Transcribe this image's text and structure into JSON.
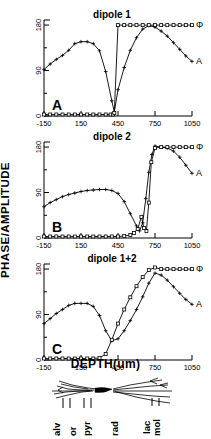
{
  "figure": {
    "axis_y_label": "PHASE/AMPLITUDE",
    "axis_x_label": "DEPTH(um)",
    "series_label_phase": "Φ",
    "series_label_amplitude": "A"
  },
  "panels": [
    {
      "tag": "A",
      "title": "dipole 1",
      "yticks": [
        "180",
        "90",
        "0"
      ],
      "xticks": [
        "-150",
        "150",
        "450",
        "750",
        "1050"
      ]
    },
    {
      "tag": "B",
      "title": "dipole 2",
      "yticks": [
        "180",
        "90",
        "0"
      ],
      "xticks": [
        "-150",
        "150",
        "450",
        "750",
        "1050"
      ]
    },
    {
      "tag": "C",
      "title": "dipole 1+2",
      "yticks": [
        "180",
        "90",
        "0"
      ],
      "xticks": [
        "-150",
        "150",
        "450",
        "750",
        "1050"
      ]
    }
  ],
  "layers": [
    {
      "name": "alv"
    },
    {
      "name": "or"
    },
    {
      "name": "pyr"
    },
    {
      "name": "rad"
    },
    {
      "name": "lac"
    },
    {
      "name": "mol"
    }
  ],
  "chart_data": [
    {
      "type": "line",
      "title": "dipole 1",
      "panel": "A",
      "xlabel": "DEPTH(um)",
      "ylabel": "PHASE/AMPLITUDE",
      "xlim": [
        -150,
        1050
      ],
      "ylim": [
        0,
        190
      ],
      "xticks": [
        -150,
        150,
        450,
        750,
        1050
      ],
      "yticks": [
        0,
        90,
        180
      ],
      "grid": false,
      "legend": [
        "Φ",
        "A"
      ],
      "legend_position": "right-inline",
      "series": [
        {
          "name": "A",
          "label": "A",
          "marker": "plus",
          "x": [
            -150,
            -100,
            -50,
            0,
            50,
            100,
            150,
            200,
            250,
            300,
            350,
            400,
            420,
            450,
            500,
            550,
            600,
            650,
            700,
            750,
            800,
            850,
            900,
            950,
            1000,
            1050
          ],
          "y": [
            92,
            103,
            112,
            120,
            130,
            143,
            147,
            147,
            143,
            129,
            88,
            30,
            8,
            52,
            96,
            130,
            155,
            172,
            179,
            176,
            168,
            158,
            145,
            132,
            119,
            108
          ]
        },
        {
          "name": "Φ",
          "label": "Φ",
          "marker": "square",
          "x": [
            -150,
            -100,
            -50,
            0,
            50,
            100,
            150,
            200,
            250,
            300,
            350,
            390,
            410,
            420,
            450,
            500,
            550,
            600,
            650,
            700,
            750,
            800,
            850,
            900,
            950,
            1000,
            1050
          ],
          "y": [
            3,
            3,
            3,
            3,
            3,
            3,
            3,
            3,
            3,
            3,
            3,
            3,
            3,
            6,
            180,
            180,
            180,
            180,
            180,
            180,
            180,
            180,
            180,
            180,
            180,
            180,
            180
          ]
        }
      ]
    },
    {
      "type": "line",
      "title": "dipole 2",
      "panel": "B",
      "xlabel": "DEPTH(um)",
      "ylabel": "PHASE/AMPLITUDE",
      "xlim": [
        -150,
        1050
      ],
      "ylim": [
        0,
        190
      ],
      "xticks": [
        -150,
        150,
        450,
        750,
        1050
      ],
      "yticks": [
        0,
        90,
        180
      ],
      "grid": false,
      "legend": [
        "Φ",
        "A"
      ],
      "legend_position": "right-inline",
      "series": [
        {
          "name": "A",
          "label": "A",
          "marker": "plus",
          "x": [
            -150,
            -100,
            -50,
            0,
            50,
            100,
            150,
            200,
            250,
            300,
            350,
            400,
            450,
            500,
            550,
            600,
            625,
            650,
            675,
            700,
            725,
            750,
            800,
            850,
            900,
            950,
            1000,
            1050
          ],
          "y": [
            62,
            70,
            76,
            82,
            86,
            89,
            92,
            94,
            95,
            96,
            96,
            94,
            88,
            72,
            48,
            24,
            14,
            30,
            78,
            130,
            165,
            182,
            180,
            178,
            172,
            160,
            144,
            128
          ]
        },
        {
          "name": "Φ",
          "label": "Φ",
          "marker": "square",
          "x": [
            -150,
            -100,
            -50,
            0,
            50,
            100,
            150,
            200,
            250,
            300,
            350,
            400,
            450,
            500,
            550,
            580,
            610,
            640,
            660,
            680,
            700,
            720,
            750,
            800,
            850,
            900,
            950,
            1000,
            1050
          ],
          "y": [
            3,
            3,
            3,
            3,
            3,
            3,
            3,
            3,
            3,
            3,
            3,
            3,
            3,
            4,
            6,
            10,
            18,
            42,
            20,
            14,
            70,
            150,
            178,
            180,
            180,
            180,
            180,
            180,
            180
          ]
        }
      ]
    },
    {
      "type": "line",
      "title": "dipole 1+2",
      "panel": "C",
      "xlabel": "DEPTH(um)",
      "ylabel": "PHASE/AMPLITUDE",
      "xlim": [
        -150,
        1050
      ],
      "ylim": [
        0,
        190
      ],
      "xticks": [
        -150,
        150,
        450,
        750,
        1050
      ],
      "yticks": [
        0,
        90,
        180
      ],
      "grid": false,
      "legend": [
        "Φ",
        "A"
      ],
      "legend_position": "right-inline",
      "series": [
        {
          "name": "A",
          "label": "A",
          "marker": "plus",
          "x": [
            -150,
            -100,
            -50,
            0,
            50,
            100,
            150,
            200,
            250,
            300,
            350,
            400,
            450,
            500,
            550,
            600,
            650,
            700,
            750,
            800,
            850,
            900,
            950,
            1000,
            1050
          ],
          "y": [
            72,
            82,
            92,
            100,
            108,
            112,
            112,
            112,
            106,
            88,
            58,
            38,
            42,
            58,
            78,
            100,
            125,
            152,
            172,
            168,
            158,
            145,
            132,
            120,
            110
          ]
        },
        {
          "name": "Φ",
          "label": "Φ",
          "marker": "square",
          "x": [
            -150,
            -100,
            -50,
            0,
            50,
            100,
            150,
            200,
            250,
            300,
            350,
            400,
            450,
            500,
            550,
            600,
            650,
            700,
            750,
            800,
            850,
            900,
            950,
            1000,
            1050
          ],
          "y": [
            3,
            3,
            3,
            3,
            3,
            3,
            3,
            3,
            3,
            4,
            12,
            40,
            72,
            100,
            124,
            146,
            164,
            178,
            183,
            180,
            180,
            180,
            180,
            180,
            180
          ]
        }
      ]
    }
  ]
}
